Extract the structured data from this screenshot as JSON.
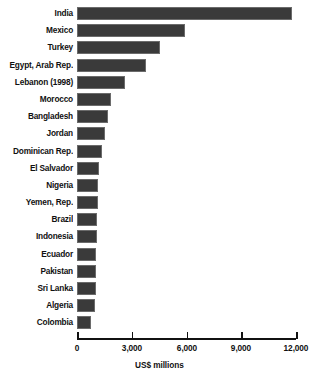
{
  "chart_data": {
    "type": "bar",
    "orientation": "horizontal",
    "title": "",
    "xlabel": "US$ millions",
    "ylabel": "",
    "xlim": [
      0,
      12000
    ],
    "xticks": [
      0,
      3000,
      6000,
      9000,
      12000
    ],
    "xtick_labels": [
      "0",
      "3,000",
      "6,000",
      "9,000",
      "12,000"
    ],
    "grid": false,
    "legend": false,
    "bar_color": "#3a3a3a",
    "categories": [
      "India",
      "Mexico",
      "Turkey",
      "Egypt, Arab Rep.",
      "Lebanon (1998)",
      "Morocco",
      "Bangladesh",
      "Jordan",
      "Dominican Rep.",
      "El Salvador",
      "Nigeria",
      "Yemen, Rep.",
      "Brazil",
      "Indonesia",
      "Ecuador",
      "Pakistan",
      "Sri Lanka",
      "Algeria",
      "Colombia"
    ],
    "values": [
      11800,
      5920,
      4550,
      3780,
      2630,
      1870,
      1700,
      1540,
      1370,
      1210,
      1150,
      1130,
      1110,
      1080,
      1060,
      1040,
      1020,
      990,
      770
    ]
  }
}
